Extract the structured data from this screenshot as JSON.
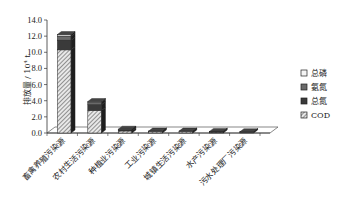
{
  "chart_data": {
    "type": "bar",
    "stacked": true,
    "title": "",
    "xlabel": "",
    "ylabel": "排放量 / 10⁴ t",
    "ylim": [
      0,
      14
    ],
    "yticks": [
      "0.0",
      "2.0",
      "4.0",
      "6.0",
      "8.0",
      "10.0",
      "12.0",
      "14.0"
    ],
    "categories": [
      "畜禽养殖污染源",
      "农村生活污染源",
      "种植业污染源",
      "工业污染源",
      "城镇生活污染源",
      "水产污染源",
      "污水处理厂污染源"
    ],
    "series": [
      {
        "name": "COD",
        "values": [
          10.3,
          2.8,
          0.25,
          0.15,
          0.15,
          0.12,
          0.1
        ]
      },
      {
        "name": "总氮",
        "values": [
          1.2,
          0.7,
          0.15,
          0.05,
          0.05,
          0.05,
          0.03
        ]
      },
      {
        "name": "氨氮",
        "values": [
          0.5,
          0.3,
          0.05,
          0.03,
          0.03,
          0.02,
          0.02
        ]
      },
      {
        "name": "总磷",
        "values": [
          0.2,
          0.1,
          0.02,
          0.01,
          0.01,
          0.01,
          0.01
        ]
      }
    ],
    "legend": [
      "总磷",
      "氨氮",
      "总氮",
      "COD"
    ],
    "legend_position": "right",
    "grid": false,
    "style": "3d"
  }
}
